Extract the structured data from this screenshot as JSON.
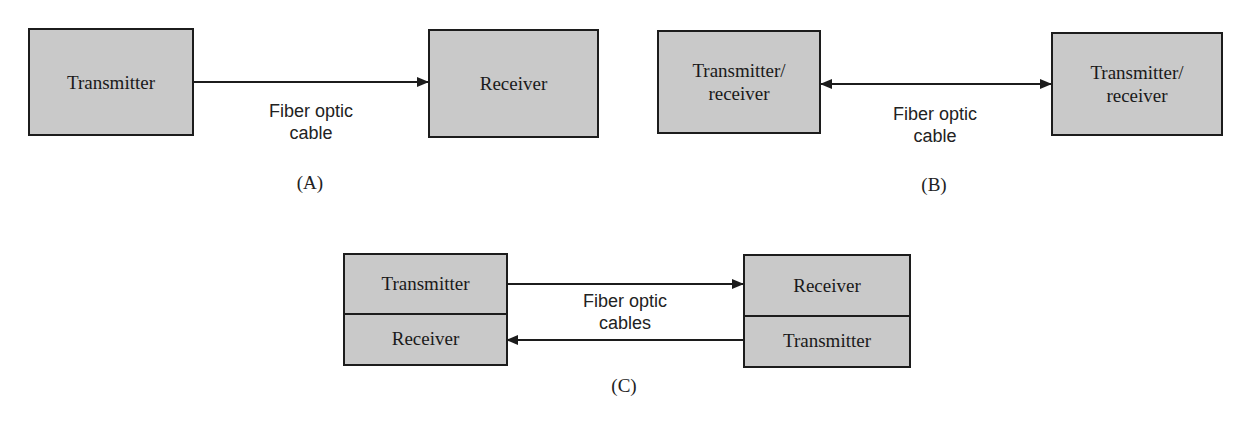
{
  "diagram_a": {
    "left_box": "Transmitter",
    "right_box": "Receiver",
    "link_label_line1": "Fiber optic",
    "link_label_line2": "cable",
    "arrow": "one-way left-to-right",
    "caption": "(A)"
  },
  "diagram_b": {
    "left_box_line1": "Transmitter/",
    "left_box_line2": "receiver",
    "right_box_line1": "Transmitter/",
    "right_box_line2": "receiver",
    "link_label_line1": "Fiber optic",
    "link_label_line2": "cable",
    "arrow": "bidirectional",
    "caption": "(B)"
  },
  "diagram_c": {
    "left_top": "Transmitter",
    "left_bottom": "Receiver",
    "right_top": "Receiver",
    "right_bottom": "Transmitter",
    "link_label_line1": "Fiber optic",
    "link_label_line2": "cables",
    "arrows": [
      "top: left-to-right",
      "bottom: right-to-left"
    ],
    "caption": "(C)"
  },
  "colors": {
    "box_fill": "#c9c9c9",
    "border": "#1c1c1c",
    "background": "#ffffff"
  }
}
